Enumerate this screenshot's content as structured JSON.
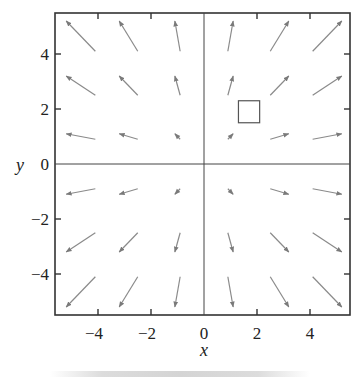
{
  "chart_data": {
    "type": "vector_field",
    "title": "",
    "xlabel": "x",
    "ylabel": "y",
    "field": "F(x, y) = (x, y)",
    "xlim": [
      -5.6,
      5.5
    ],
    "ylim": [
      -5.5,
      5.5
    ],
    "xticks": [
      -4,
      -2,
      0,
      2,
      4
    ],
    "yticks": [
      -4,
      -2,
      0,
      2,
      4
    ],
    "xtick_labels": [
      "−4",
      "−2",
      "0",
      "2",
      "4"
    ],
    "ytick_labels": [
      "−4",
      "−2",
      "0",
      "2",
      "4"
    ],
    "grid": false,
    "axes_lines_through_origin": true,
    "arrow_color": "#8a8a8a",
    "axis_color": "#333333",
    "arrow_head_scale": 1.27,
    "sample_points": [
      -4.1,
      -2.5,
      -0.9,
      0.9,
      2.5,
      4.1
    ],
    "arrows": [
      {
        "x": -4.1,
        "y": 4.1,
        "u": -1.1,
        "v": 1.1
      },
      {
        "x": -2.5,
        "y": 4.1,
        "u": -0.7,
        "v": 1.1
      },
      {
        "x": -0.9,
        "y": 4.1,
        "u": -0.2,
        "v": 1.1
      },
      {
        "x": 0.9,
        "y": 4.1,
        "u": 0.2,
        "v": 1.1
      },
      {
        "x": 2.5,
        "y": 4.1,
        "u": 0.7,
        "v": 1.1
      },
      {
        "x": 4.1,
        "y": 4.1,
        "u": 1.1,
        "v": 1.1
      },
      {
        "x": -4.1,
        "y": 2.5,
        "u": -1.1,
        "v": 0.7
      },
      {
        "x": -2.5,
        "y": 2.5,
        "u": -0.7,
        "v": 0.7
      },
      {
        "x": -0.9,
        "y": 2.5,
        "u": -0.2,
        "v": 0.7
      },
      {
        "x": 0.9,
        "y": 2.5,
        "u": 0.2,
        "v": 0.7
      },
      {
        "x": 2.5,
        "y": 2.5,
        "u": 0.7,
        "v": 0.7
      },
      {
        "x": 4.1,
        "y": 2.5,
        "u": 1.1,
        "v": 0.7
      },
      {
        "x": -4.1,
        "y": 0.9,
        "u": -1.1,
        "v": 0.2
      },
      {
        "x": -2.5,
        "y": 0.9,
        "u": -0.7,
        "v": 0.2
      },
      {
        "x": -0.9,
        "y": 0.9,
        "u": -0.2,
        "v": 0.2
      },
      {
        "x": 0.9,
        "y": 0.9,
        "u": 0.2,
        "v": 0.2
      },
      {
        "x": 2.5,
        "y": 0.9,
        "u": 0.7,
        "v": 0.2
      },
      {
        "x": 4.1,
        "y": 0.9,
        "u": 1.1,
        "v": 0.2
      },
      {
        "x": -4.1,
        "y": -0.9,
        "u": -1.1,
        "v": -0.2
      },
      {
        "x": -2.5,
        "y": -0.9,
        "u": -0.7,
        "v": -0.2
      },
      {
        "x": -0.9,
        "y": -0.9,
        "u": -0.2,
        "v": -0.2
      },
      {
        "x": 0.9,
        "y": -0.9,
        "u": 0.2,
        "v": -0.2
      },
      {
        "x": 2.5,
        "y": -0.9,
        "u": 0.7,
        "v": -0.2
      },
      {
        "x": 4.1,
        "y": -0.9,
        "u": 1.1,
        "v": -0.2
      },
      {
        "x": -4.1,
        "y": -2.5,
        "u": -1.1,
        "v": -0.7
      },
      {
        "x": -2.5,
        "y": -2.5,
        "u": -0.7,
        "v": -0.7
      },
      {
        "x": -0.9,
        "y": -2.5,
        "u": -0.2,
        "v": -0.7
      },
      {
        "x": 0.9,
        "y": -2.5,
        "u": 0.2,
        "v": -0.7
      },
      {
        "x": 2.5,
        "y": -2.5,
        "u": 0.7,
        "v": -0.7
      },
      {
        "x": 4.1,
        "y": -2.5,
        "u": 1.1,
        "v": -0.7
      },
      {
        "x": -4.1,
        "y": -4.1,
        "u": -1.1,
        "v": -1.1
      },
      {
        "x": -2.5,
        "y": -4.1,
        "u": -0.7,
        "v": -1.1
      },
      {
        "x": -0.9,
        "y": -4.1,
        "u": -0.2,
        "v": -1.1
      },
      {
        "x": 0.9,
        "y": -4.1,
        "u": 0.2,
        "v": -1.1
      },
      {
        "x": 2.5,
        "y": -4.1,
        "u": 0.7,
        "v": -1.1
      },
      {
        "x": 4.1,
        "y": -4.1,
        "u": 1.1,
        "v": -1.1
      }
    ],
    "annotations": [
      {
        "type": "square",
        "x0": 1.3,
        "y0": 1.5,
        "x1": 2.1,
        "y1": 2.3,
        "color": "#555555"
      }
    ]
  }
}
